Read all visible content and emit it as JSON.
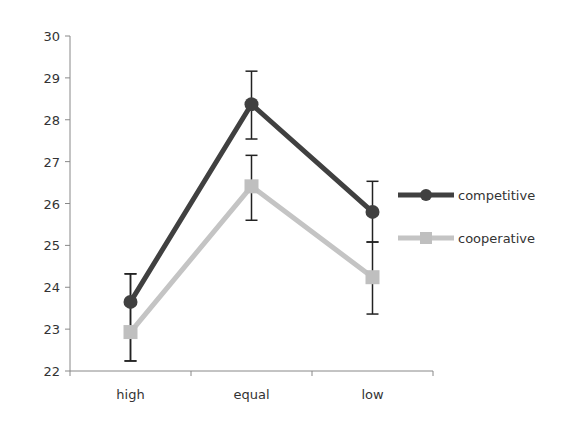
{
  "chart_data": {
    "type": "line",
    "title": "",
    "xlabel": "",
    "ylabel": "",
    "categories": [
      "high",
      "equal",
      "low"
    ],
    "ylim": [
      22,
      30
    ],
    "yticks": [
      22,
      23,
      24,
      25,
      26,
      27,
      28,
      29,
      30
    ],
    "grid": false,
    "legend_position": "right",
    "series": [
      {
        "name": "competitive",
        "color": "#404040",
        "marker": "circle",
        "values": [
          23.65,
          28.37,
          25.8
        ],
        "error_upper": [
          24.32,
          29.16,
          26.53
        ],
        "error_lower": [
          22.24,
          27.54,
          25.08
        ]
      },
      {
        "name": "cooperative",
        "color": "#bfbfbf",
        "marker": "square",
        "values": [
          22.93,
          26.41,
          24.24
        ],
        "error_upper": [
          24.32,
          27.15,
          25.08
        ],
        "error_lower": [
          22.24,
          25.6,
          23.36
        ]
      }
    ]
  },
  "legend": {
    "competitive": "competitive",
    "cooperative": "cooperative"
  }
}
